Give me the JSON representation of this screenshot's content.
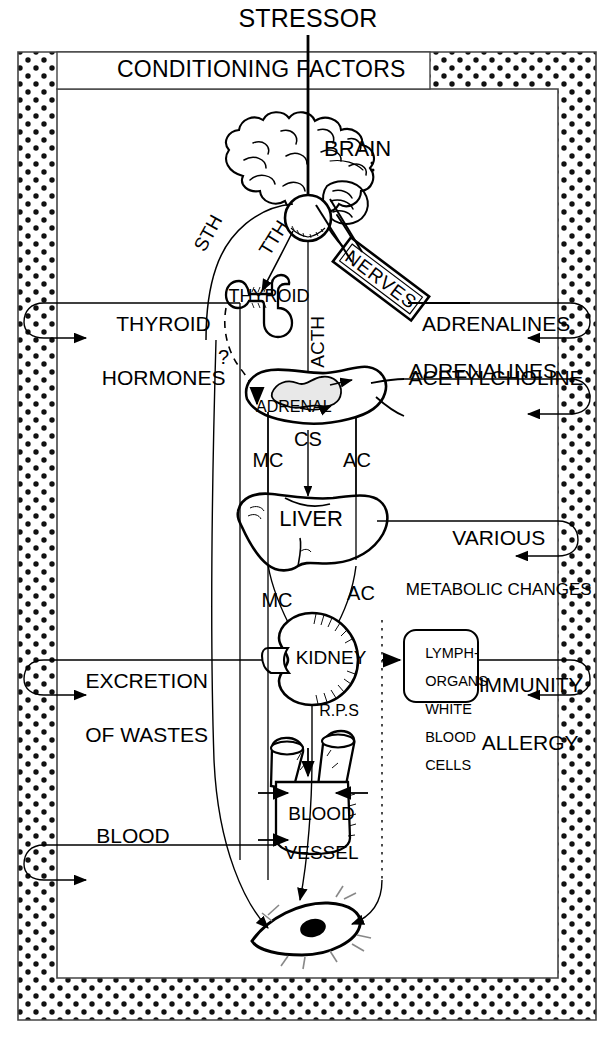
{
  "diagram": {
    "top_label": "STRESSOR",
    "frame_label": "CONDITIONING FACTORS"
  },
  "organs": {
    "brain": "BRAIN",
    "thyroid": "THYROID",
    "adrenal": "ADRENAL",
    "liver": "LIVER",
    "kidney": "KIDNEY",
    "blood_vessel_line1": "BLOOD",
    "blood_vessel_line2": "VESSEL"
  },
  "nerves_banner": "NERVES",
  "hormone_paths": {
    "sth": "STH",
    "tth": "TTH",
    "acth": "ACTH",
    "question": "?",
    "adrenal_mc": "MC",
    "adrenal_cs": "CS",
    "adrenal_ac": "AC",
    "kidney_mc": "MC",
    "kidney_ac": "AC",
    "rps": "R.P.S"
  },
  "left_outputs": [
    {
      "line1": "THYROID",
      "line2": "HORMONES"
    },
    {
      "line1": "EXCRETION",
      "line2": "OF WASTES"
    },
    {
      "line1": "BLOOD",
      "line2": ""
    }
  ],
  "right_outputs": [
    {
      "line1": "ADRENALINES",
      "line2": "ACETYLCHOLINE"
    },
    {
      "line1": "ADRENALINES",
      "line2": ""
    },
    {
      "line1": "VARIOUS",
      "line2": "METABOLIC CHANGES"
    },
    {
      "line1": "IMMUNITY",
      "line2": "ALLERGY"
    }
  ],
  "lymph_box": {
    "lines": [
      "LYMPH-",
      "ORGANS",
      "WHITE",
      "BLOOD",
      "CELLS"
    ]
  },
  "colors": {
    "ink": "#000000",
    "paper": "#ffffff",
    "stipple_dot": "#111111",
    "organ_fill_light": "#e8e8e8",
    "hatch": "#555555"
  }
}
